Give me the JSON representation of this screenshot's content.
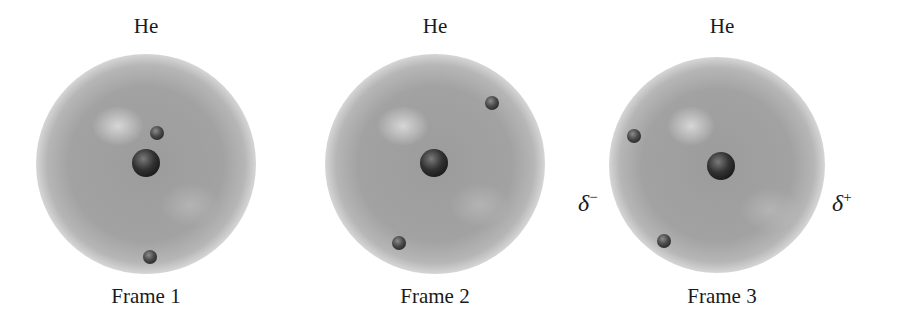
{
  "frames": [
    {
      "title": "He",
      "caption": "Frame 1",
      "cloud": {
        "cx": 146,
        "cy": 164,
        "r": 110
      },
      "nucleus": {
        "cx": 146,
        "cy": 163,
        "r": 14
      },
      "electrons": [
        {
          "cx": 157,
          "cy": 133,
          "r": 7
        },
        {
          "cx": 150,
          "cy": 257,
          "r": 7
        }
      ]
    },
    {
      "title": "He",
      "caption": "Frame 2",
      "cloud": {
        "cx": 435,
        "cy": 164,
        "r": 110
      },
      "nucleus": {
        "cx": 434,
        "cy": 163,
        "r": 14
      },
      "electrons": [
        {
          "cx": 492,
          "cy": 103,
          "r": 7
        },
        {
          "cx": 399,
          "cy": 243,
          "r": 7
        }
      ]
    },
    {
      "title": "He",
      "caption": "Frame 3",
      "cloud": {
        "cx": 717,
        "cy": 165,
        "r": 108
      },
      "nucleus": {
        "cx": 721,
        "cy": 166,
        "r": 14
      },
      "electrons": [
        {
          "cx": 634,
          "cy": 136,
          "r": 7
        },
        {
          "cx": 664,
          "cy": 241,
          "r": 7
        }
      ],
      "partial_charges": {
        "left": {
          "symbol": "δ",
          "sign": "−"
        },
        "right": {
          "symbol": "δ",
          "sign": "+"
        }
      }
    }
  ],
  "colors": {
    "cloud": "#9a9a9a",
    "cloud_edge": "#c4c4c4",
    "highlight": "#d8d8d8",
    "nucleus": "#2f2f2f",
    "electron": "#4a4a4a",
    "text": "#1a1a1a"
  }
}
